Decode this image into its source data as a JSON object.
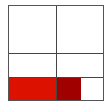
{
  "grid": {
    "rows": 3,
    "cols": 2,
    "border_color": "#555555",
    "line_color": "#444444"
  },
  "bar_row": {
    "segments": [
      {
        "name": "bright-red-segment",
        "color": "#dd1100"
      },
      {
        "name": "dark-red-segment",
        "color": "#a00000"
      },
      {
        "name": "empty-segment",
        "color": "#ffffff"
      }
    ]
  }
}
